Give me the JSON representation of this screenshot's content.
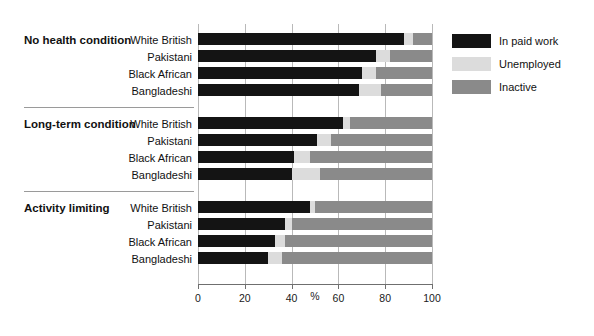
{
  "chart_data": {
    "type": "bar",
    "orientation": "horizontal",
    "stacked": true,
    "stacked_percent": true,
    "title": "",
    "xlabel": "%",
    "ylabel": "",
    "xlim": [
      0,
      100
    ],
    "xticks": [
      0,
      20,
      40,
      60,
      80,
      100
    ],
    "xticklabels": [
      "0",
      "20",
      "40",
      "60",
      "80",
      "100"
    ],
    "grid": true,
    "grid_axis": "x",
    "legend_position": "right",
    "legend": [
      "In paid work",
      "Unemployed",
      "Inactive"
    ],
    "series": [
      {
        "name": "In paid work",
        "color": "#141414",
        "values": [
          88,
          76,
          70,
          69,
          62,
          51,
          41,
          40,
          48,
          37,
          33,
          30
        ]
      },
      {
        "name": "Unemployed",
        "color": "#dcdcdc",
        "values": [
          4,
          6,
          6,
          9,
          3,
          6,
          7,
          12,
          2,
          3,
          4,
          6
        ]
      },
      {
        "name": "Inactive",
        "color": "#8a8a8a",
        "values": [
          8,
          18,
          24,
          22,
          35,
          43,
          52,
          48,
          50,
          60,
          63,
          64
        ]
      }
    ],
    "groups": [
      {
        "label": "No health condition",
        "categories": [
          "White British",
          "Pakistani",
          "Black African",
          "Bangladeshi"
        ],
        "rows": [
          {
            "category": "White British",
            "in_paid_work": 88,
            "unemployed": 4,
            "inactive": 8
          },
          {
            "category": "Pakistani",
            "in_paid_work": 76,
            "unemployed": 6,
            "inactive": 18
          },
          {
            "category": "Black African",
            "in_paid_work": 70,
            "unemployed": 6,
            "inactive": 24
          },
          {
            "category": "Bangladeshi",
            "in_paid_work": 69,
            "unemployed": 9,
            "inactive": 22
          }
        ]
      },
      {
        "label": "Long-term condition",
        "categories": [
          "White British",
          "Pakistani",
          "Black African",
          "Bangladeshi"
        ],
        "rows": [
          {
            "category": "White British",
            "in_paid_work": 62,
            "unemployed": 3,
            "inactive": 35
          },
          {
            "category": "Pakistani",
            "in_paid_work": 51,
            "unemployed": 6,
            "inactive": 43
          },
          {
            "category": "Black African",
            "in_paid_work": 41,
            "unemployed": 7,
            "inactive": 52
          },
          {
            "category": "Bangladeshi",
            "in_paid_work": 40,
            "unemployed": 12,
            "inactive": 48
          }
        ]
      },
      {
        "label": "Activity limiting",
        "categories": [
          "White British",
          "Pakistani",
          "Black African",
          "Bangladeshi"
        ],
        "rows": [
          {
            "category": "White British",
            "in_paid_work": 48,
            "unemployed": 2,
            "inactive": 50
          },
          {
            "category": "Pakistani",
            "in_paid_work": 37,
            "unemployed": 3,
            "inactive": 60
          },
          {
            "category": "Black African",
            "in_paid_work": 33,
            "unemployed": 4,
            "inactive": 63
          },
          {
            "category": "Bangladeshi",
            "in_paid_work": 30,
            "unemployed": 6,
            "inactive": 64
          }
        ]
      }
    ]
  },
  "colors": {
    "in_paid_work": "#141414",
    "unemployed": "#dcdcdc",
    "inactive": "#8a8a8a",
    "grid": "#b9b9b9",
    "axis": "#6f6f6f",
    "separator": "#9a9a9a",
    "text": "#111111",
    "background": "#ffffff"
  }
}
